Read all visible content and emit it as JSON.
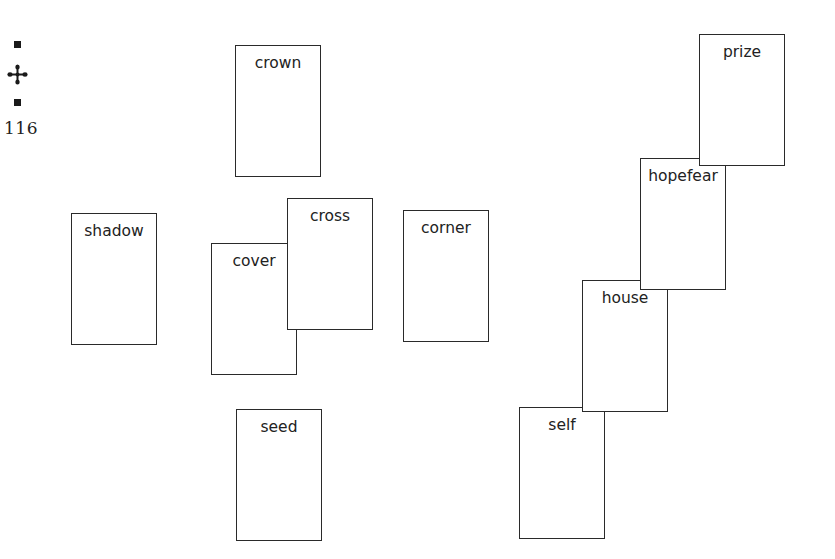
{
  "toolbox": {
    "top_handle_icon": "square-handle-icon",
    "move_icon": "four-way-move-icon",
    "bottom_handle_icon": "square-handle-icon",
    "page_number": "116"
  },
  "cards": [
    {
      "id": "self",
      "label": "self",
      "x": 519,
      "y": 407,
      "z": 1
    },
    {
      "id": "house",
      "label": "house",
      "x": 582,
      "y": 280,
      "z": 2
    },
    {
      "id": "hopefear",
      "label": "hopefear",
      "x": 640,
      "y": 158,
      "z": 3
    },
    {
      "id": "prize",
      "label": "prize",
      "x": 699,
      "y": 34,
      "z": 4
    },
    {
      "id": "crown",
      "label": "crown",
      "x": 235,
      "y": 45,
      "z": 1
    },
    {
      "id": "shadow",
      "label": "shadow",
      "x": 71,
      "y": 213,
      "z": 1
    },
    {
      "id": "cover",
      "label": "cover",
      "x": 211,
      "y": 243,
      "z": 1
    },
    {
      "id": "cross",
      "label": "cross",
      "x": 287,
      "y": 198,
      "z": 2
    },
    {
      "id": "corner",
      "label": "corner",
      "x": 403,
      "y": 210,
      "z": 1
    },
    {
      "id": "seed",
      "label": "seed",
      "x": 236,
      "y": 409,
      "z": 1
    }
  ],
  "colors": {
    "background": "#ffffff",
    "card_border": "#2a2a2a",
    "text": "#222222"
  }
}
